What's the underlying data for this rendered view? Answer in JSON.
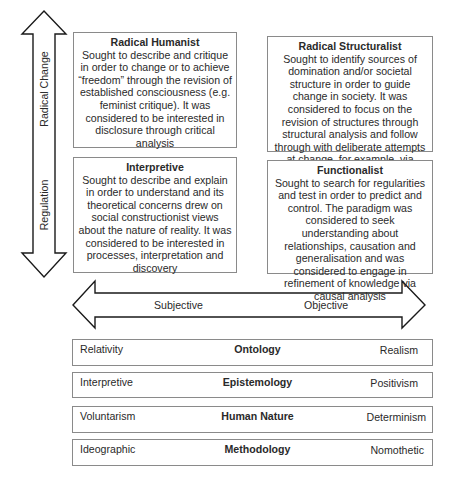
{
  "vertical_axis": {
    "top_label": "Radical Change",
    "bottom_label": "Regulation"
  },
  "horizontal_axis": {
    "left_label": "Subjective",
    "right_label": "Objective"
  },
  "quadrants": [
    {
      "position": "top-left",
      "title": "Radical Humanist",
      "body": "Sought to describe and critique in order to change or to achieve “freedom” through the revision of established consciousness (e.g. feminist critique). It was considered to be interested in disclosure through critical analysis"
    },
    {
      "position": "top-right",
      "title": "Radical Structuralist",
      "body": "Sought to identify sources of domination and/or societal structure in order to guide change in society. It was considered to focus on the revision of structures through structural analysis and follow through with deliberate attempts at change, for example, via emancipation"
    },
    {
      "position": "bottom-left",
      "title": "Interpretive",
      "body": "Sought to describe and explain in order to understand and its theoretical concerns drew on social constructionist views about the nature of reality. It was considered to be interested in processes, interpretation and discovery"
    },
    {
      "position": "bottom-right",
      "title": "Functionalist",
      "body": "Sought to search for regularities and test in order to predict and control. The paradigm was considered to seek understanding about relationships, causation and generalisation and was considered to engage in refinement of knowledge via causal analysis"
    }
  ],
  "dimensions": [
    {
      "left": "Relativity",
      "name": "Ontology",
      "right": "Realism"
    },
    {
      "left": "Interpretive",
      "name": "Epistemology",
      "right": "Positivism"
    },
    {
      "left": "Voluntarism",
      "name": "Human Nature",
      "right": "Determinism"
    },
    {
      "left": "Ideographic",
      "name": "Methodology",
      "right": "Nomothetic"
    }
  ],
  "colors": {
    "stroke": "#1a1a1a",
    "box_border": "#8a8a8a",
    "text": "#2a2a2a"
  }
}
